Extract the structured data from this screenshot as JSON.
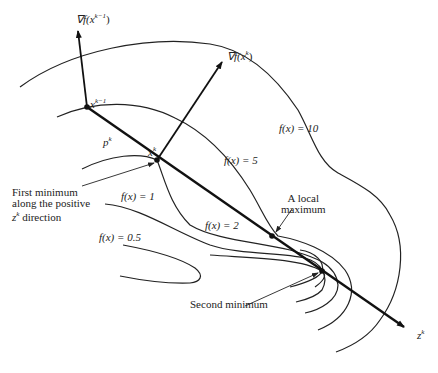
{
  "diagram": {
    "labels": {
      "grad_prev": "∇f(x",
      "grad_prev_sup": "k−1",
      "grad_prev_close": ")",
      "grad_curr": "∇f(x",
      "grad_curr_sup": "k",
      "grad_curr_close": ")",
      "x_prev": "x",
      "x_prev_sup": "k−1",
      "x_curr": "x",
      "x_curr_sup": "k",
      "p_k": "p",
      "p_k_sup": "k",
      "z_k": "z",
      "z_k_sup": "k",
      "contour_10": "f(x) = 10",
      "contour_5": "f(x) = 5",
      "contour_2": "f(x) = 2",
      "contour_1": "f(x) = 1",
      "contour_05": "f(x) = 0.5"
    },
    "annotations": {
      "first_minimum": [
        "First minimum",
        "along the positive",
        "direction"
      ],
      "first_minimum_z": "z",
      "first_minimum_z_sup": "k",
      "local_maximum": [
        "A local",
        "maximum"
      ],
      "second_minimum": "Second minimum"
    },
    "points": {
      "x_prev": [
        87,
        107
      ],
      "x_curr": [
        157,
        160
      ],
      "local_max": [
        272,
        236
      ],
      "second_min": [
        322,
        271
      ]
    },
    "colors": {
      "ink": "#111111",
      "background": "#ffffff"
    }
  }
}
